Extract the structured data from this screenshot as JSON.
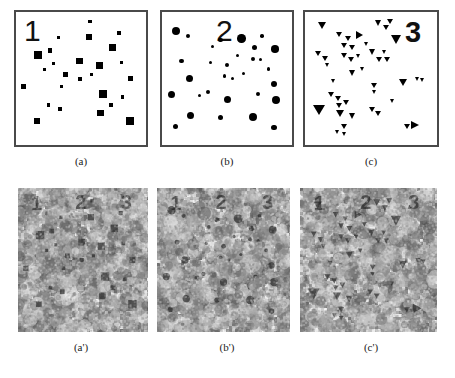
{
  "figure": {
    "type": "stimulus-figure",
    "ink_color": "#000000",
    "frame_color": "#4a4a4a",
    "background_color": "#ffffff"
  },
  "panels": [
    {
      "id": "a",
      "caption": "(a)",
      "digit": "1",
      "element_shape": "square",
      "count": 26
    },
    {
      "id": "b",
      "caption": "(b)",
      "digit": "2",
      "element_shape": "circle",
      "count": 31
    },
    {
      "id": "c",
      "caption": "(c)",
      "digit": "3",
      "element_shape": "triangle",
      "count": 44
    },
    {
      "id": "a-prime",
      "caption": "(a')",
      "digits": [
        "1",
        "2",
        "3"
      ],
      "element_shape": "square",
      "noise": "visual-noise"
    },
    {
      "id": "b-prime",
      "caption": "(b')",
      "digits": [
        "1",
        "2",
        "3"
      ],
      "element_shape": "circle",
      "noise": "visual-noise"
    },
    {
      "id": "c-prime",
      "caption": "(c')",
      "digits": [
        "1",
        "2",
        "3"
      ],
      "element_shape": "triangle",
      "noise": "visual-noise"
    }
  ],
  "chart_data": {
    "type": "scatter",
    "title": "",
    "xlabel": "",
    "ylabel": "",
    "xlim": [
      0,
      100
    ],
    "ylim": [
      0,
      100
    ],
    "grid": false,
    "legend": "none",
    "panels": [
      {
        "name": "(a)",
        "marker": "square",
        "label": "1",
        "points": [
          {
            "x": 57,
            "y": 7,
            "size": 3.5
          },
          {
            "x": 33,
            "y": 19,
            "size": 3.2
          },
          {
            "x": 56,
            "y": 19,
            "size": 6.0
          },
          {
            "x": 79,
            "y": 16,
            "size": 4.0
          },
          {
            "x": 74,
            "y": 27,
            "size": 7.0
          },
          {
            "x": 17,
            "y": 32,
            "size": 8.0
          },
          {
            "x": 26,
            "y": 29,
            "size": 4.5
          },
          {
            "x": 29,
            "y": 39,
            "size": 3.0
          },
          {
            "x": 22,
            "y": 43,
            "size": 3.0
          },
          {
            "x": 49,
            "y": 37,
            "size": 6.5
          },
          {
            "x": 64,
            "y": 40,
            "size": 7.0
          },
          {
            "x": 81,
            "y": 38,
            "size": 3.5
          },
          {
            "x": 38,
            "y": 47,
            "size": 4.5
          },
          {
            "x": 49,
            "y": 50,
            "size": 4.0
          },
          {
            "x": 58,
            "y": 47,
            "size": 3.0
          },
          {
            "x": 88,
            "y": 50,
            "size": 5.5
          },
          {
            "x": 6,
            "y": 56,
            "size": 5.0
          },
          {
            "x": 35,
            "y": 56,
            "size": 3.5
          },
          {
            "x": 67,
            "y": 62,
            "size": 8.0
          },
          {
            "x": 82,
            "y": 64,
            "size": 3.5
          },
          {
            "x": 25,
            "y": 70,
            "size": 3.5
          },
          {
            "x": 34,
            "y": 73,
            "size": 4.5
          },
          {
            "x": 73,
            "y": 70,
            "size": 4.5
          },
          {
            "x": 65,
            "y": 76,
            "size": 6.5
          },
          {
            "x": 16,
            "y": 82,
            "size": 5.5
          },
          {
            "x": 88,
            "y": 82,
            "size": 8.0
          }
        ]
      },
      {
        "name": "(b)",
        "marker": "circle",
        "label": "2",
        "points": [
          {
            "x": 11,
            "y": 14,
            "size": 8.0
          },
          {
            "x": 20,
            "y": 18,
            "size": 4.0
          },
          {
            "x": 45,
            "y": 21,
            "size": 4.5
          },
          {
            "x": 39,
            "y": 26,
            "size": 3.5
          },
          {
            "x": 61,
            "y": 20,
            "size": 8.5
          },
          {
            "x": 77,
            "y": 18,
            "size": 3.5
          },
          {
            "x": 71,
            "y": 27,
            "size": 5.0
          },
          {
            "x": 87,
            "y": 28,
            "size": 7.5
          },
          {
            "x": 70,
            "y": 35,
            "size": 4.0
          },
          {
            "x": 76,
            "y": 36,
            "size": 3.0
          },
          {
            "x": 15,
            "y": 37,
            "size": 4.5
          },
          {
            "x": 37,
            "y": 38,
            "size": 3.0
          },
          {
            "x": 50,
            "y": 40,
            "size": 4.5
          },
          {
            "x": 48,
            "y": 48,
            "size": 3.5
          },
          {
            "x": 54,
            "y": 50,
            "size": 3.0
          },
          {
            "x": 21,
            "y": 50,
            "size": 7.0
          },
          {
            "x": 86,
            "y": 54,
            "size": 6.0
          },
          {
            "x": 35,
            "y": 60,
            "size": 4.0
          },
          {
            "x": 7,
            "y": 62,
            "size": 7.0
          },
          {
            "x": 50,
            "y": 66,
            "size": 7.0
          },
          {
            "x": 74,
            "y": 62,
            "size": 4.0
          },
          {
            "x": 88,
            "y": 66,
            "size": 8.0
          },
          {
            "x": 22,
            "y": 78,
            "size": 7.0
          },
          {
            "x": 45,
            "y": 79,
            "size": 5.0
          },
          {
            "x": 70,
            "y": 79,
            "size": 8.0
          },
          {
            "x": 10,
            "y": 86,
            "size": 5.0
          },
          {
            "x": 86,
            "y": 87,
            "size": 5.5
          },
          {
            "x": 29,
            "y": 63,
            "size": 3.0
          },
          {
            "x": 63,
            "y": 46,
            "size": 3.0
          },
          {
            "x": 82,
            "y": 43,
            "size": 3.5
          },
          {
            "x": 58,
            "y": 33,
            "size": 3.0
          }
        ]
      },
      {
        "name": "(c)",
        "marker": "triangle",
        "label": "3",
        "points": [
          {
            "x": 13,
            "y": 10,
            "size": 7,
            "dir": "down"
          },
          {
            "x": 26,
            "y": 17,
            "size": 5,
            "dir": "down"
          },
          {
            "x": 33,
            "y": 20,
            "size": 5,
            "dir": "down"
          },
          {
            "x": 42,
            "y": 17,
            "size": 7,
            "dir": "right"
          },
          {
            "x": 56,
            "y": 8,
            "size": 6,
            "dir": "down"
          },
          {
            "x": 62,
            "y": 12,
            "size": 5,
            "dir": "down"
          },
          {
            "x": 65,
            "y": 7,
            "size": 5,
            "dir": "down"
          },
          {
            "x": 70,
            "y": 21,
            "size": 9,
            "dir": "down"
          },
          {
            "x": 30,
            "y": 25,
            "size": 5,
            "dir": "down"
          },
          {
            "x": 36,
            "y": 27,
            "size": 5,
            "dir": "down"
          },
          {
            "x": 10,
            "y": 31,
            "size": 5,
            "dir": "down"
          },
          {
            "x": 15,
            "y": 35,
            "size": 5,
            "dir": "down"
          },
          {
            "x": 30,
            "y": 33,
            "size": 5,
            "dir": "down"
          },
          {
            "x": 35,
            "y": 36,
            "size": 5,
            "dir": "down"
          },
          {
            "x": 52,
            "y": 30,
            "size": 6,
            "dir": "down"
          },
          {
            "x": 57,
            "y": 36,
            "size": 5,
            "dir": "down"
          },
          {
            "x": 63,
            "y": 36,
            "size": 5,
            "dir": "down"
          },
          {
            "x": 36,
            "y": 46,
            "size": 6,
            "dir": "down"
          },
          {
            "x": 53,
            "y": 55,
            "size": 5,
            "dir": "down"
          },
          {
            "x": 53,
            "y": 60,
            "size": 4,
            "dir": "down"
          },
          {
            "x": 75,
            "y": 53,
            "size": 7,
            "dir": "down"
          },
          {
            "x": 86,
            "y": 50,
            "size": 4,
            "dir": "down"
          },
          {
            "x": 90,
            "y": 51,
            "size": 4,
            "dir": "down"
          },
          {
            "x": 20,
            "y": 62,
            "size": 5,
            "dir": "down"
          },
          {
            "x": 25,
            "y": 65,
            "size": 5,
            "dir": "down"
          },
          {
            "x": 26,
            "y": 70,
            "size": 5,
            "dir": "down"
          },
          {
            "x": 31,
            "y": 68,
            "size": 5,
            "dir": "down"
          },
          {
            "x": 10,
            "y": 74,
            "size": 10,
            "dir": "down"
          },
          {
            "x": 27,
            "y": 76,
            "size": 7,
            "dir": "down"
          },
          {
            "x": 36,
            "y": 78,
            "size": 6,
            "dir": "down"
          },
          {
            "x": 51,
            "y": 73,
            "size": 5,
            "dir": "down"
          },
          {
            "x": 56,
            "y": 76,
            "size": 5,
            "dir": "down"
          },
          {
            "x": 30,
            "y": 86,
            "size": 5,
            "dir": "down"
          },
          {
            "x": 25,
            "y": 90,
            "size": 4,
            "dir": "down"
          },
          {
            "x": 30,
            "y": 92,
            "size": 4,
            "dir": "down"
          },
          {
            "x": 78,
            "y": 86,
            "size": 5,
            "dir": "down"
          },
          {
            "x": 85,
            "y": 85,
            "size": 8,
            "dir": "right"
          },
          {
            "x": 44,
            "y": 43,
            "size": 4,
            "dir": "down"
          },
          {
            "x": 17,
            "y": 40,
            "size": 4,
            "dir": "down"
          },
          {
            "x": 61,
            "y": 30,
            "size": 4,
            "dir": "down"
          },
          {
            "x": 22,
            "y": 52,
            "size": 4,
            "dir": "down"
          },
          {
            "x": 67,
            "y": 67,
            "size": 4,
            "dir": "down"
          },
          {
            "x": 41,
            "y": 33,
            "size": 4,
            "dir": "down"
          },
          {
            "x": 47,
            "y": 24,
            "size": 4,
            "dir": "down"
          }
        ]
      }
    ]
  }
}
